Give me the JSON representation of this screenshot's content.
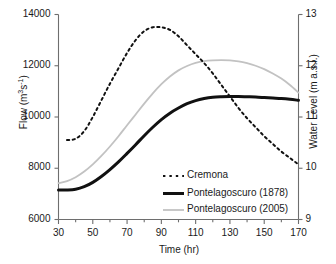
{
  "chart_data": {
    "type": "line",
    "title": "",
    "xlabel": "Time (hr)",
    "ylabel": "Flow (m3s-1)",
    "ylabel_right": "Water Level (m a.s.l.)",
    "xlim": [
      30,
      170
    ],
    "ylim": [
      6000,
      14000
    ],
    "ylim_right": [
      9,
      13
    ],
    "grid": false,
    "legend_position": "inside-center-bottom",
    "xticks": [
      30,
      50,
      70,
      90,
      110,
      130,
      150,
      170
    ],
    "xtick_labels": [
      "30",
      "50",
      "70",
      "90",
      "110",
      "130",
      "150",
      "170"
    ],
    "xminor_step": 10,
    "yticks": [
      6000,
      8000,
      10000,
      12000,
      14000
    ],
    "ytick_labels": [
      "6000",
      "8000",
      "10000",
      "12000",
      "14000"
    ],
    "yticks_right": [
      9,
      10,
      11,
      12,
      13
    ],
    "ytick_labels_right": [
      "9",
      "10",
      "11",
      "12",
      "13"
    ],
    "series": [
      {
        "name": "Cremona",
        "style": "dashed",
        "color": "#111111",
        "width": 2,
        "x": [
          35,
          40,
          45,
          50,
          55,
          60,
          65,
          70,
          75,
          80,
          85,
          90,
          95,
          100,
          105,
          110,
          115,
          120,
          125,
          130,
          135,
          140,
          145,
          150,
          155,
          160,
          165,
          170
        ],
        "y": [
          9100,
          9150,
          9450,
          10000,
          10650,
          11300,
          11900,
          12500,
          13000,
          13350,
          13500,
          13500,
          13400,
          13150,
          12800,
          12450,
          12100,
          11700,
          11250,
          10800,
          10350,
          9950,
          9600,
          9250,
          8950,
          8650,
          8400,
          8150
        ]
      },
      {
        "name": "Pontelagoscuro (1878)",
        "style": "solid",
        "color": "#111111",
        "width": 3,
        "x": [
          30,
          35,
          40,
          45,
          50,
          55,
          60,
          65,
          70,
          75,
          80,
          85,
          90,
          95,
          100,
          105,
          110,
          115,
          120,
          125,
          130,
          135,
          140,
          145,
          150,
          155,
          160,
          165,
          170
        ],
        "y": [
          7150,
          7150,
          7180,
          7280,
          7450,
          7680,
          7950,
          8250,
          8580,
          8920,
          9270,
          9600,
          9900,
          10150,
          10350,
          10520,
          10640,
          10720,
          10770,
          10790,
          10800,
          10800,
          10790,
          10780,
          10760,
          10740,
          10720,
          10690,
          10650
        ]
      },
      {
        "name": "Pontelagoscuro (2005)",
        "style": "solid",
        "color": "#c2c2c2",
        "width": 1.8,
        "x": [
          30,
          35,
          40,
          45,
          50,
          55,
          60,
          65,
          70,
          75,
          80,
          85,
          90,
          95,
          100,
          105,
          110,
          115,
          120,
          125,
          130,
          135,
          140,
          145,
          150,
          155,
          160,
          165,
          170
        ],
        "y": [
          7420,
          7500,
          7650,
          7870,
          8150,
          8480,
          8850,
          9250,
          9680,
          10100,
          10520,
          10920,
          11280,
          11580,
          11820,
          11990,
          12110,
          12180,
          12210,
          12220,
          12210,
          12170,
          12100,
          12000,
          11870,
          11700,
          11500,
          11250,
          10950
        ]
      }
    ]
  },
  "legend": {
    "items": [
      {
        "label": "Cremona",
        "style": "dashed",
        "color": "#111111"
      },
      {
        "label": "Pontelagoscuro (1878)",
        "style": "solid-thick",
        "color": "#111111"
      },
      {
        "label": "Pontelagoscuro (2005)",
        "style": "solid-thin",
        "color": "#c2c2c2"
      }
    ]
  },
  "axes": {
    "left_title_pre": "Flow (m",
    "left_title_sup1": "3",
    "left_title_mid": "s",
    "left_title_sup2": "-1",
    "left_title_post": ")",
    "right_title": "Water Level (m a.s.l.)",
    "bottom_title": "Time (hr)"
  },
  "colors": {
    "axis": "#6e6e6e",
    "text": "#1a1a1a",
    "series_dark": "#111111",
    "series_gray": "#c2c2c2",
    "background": "#ffffff"
  }
}
